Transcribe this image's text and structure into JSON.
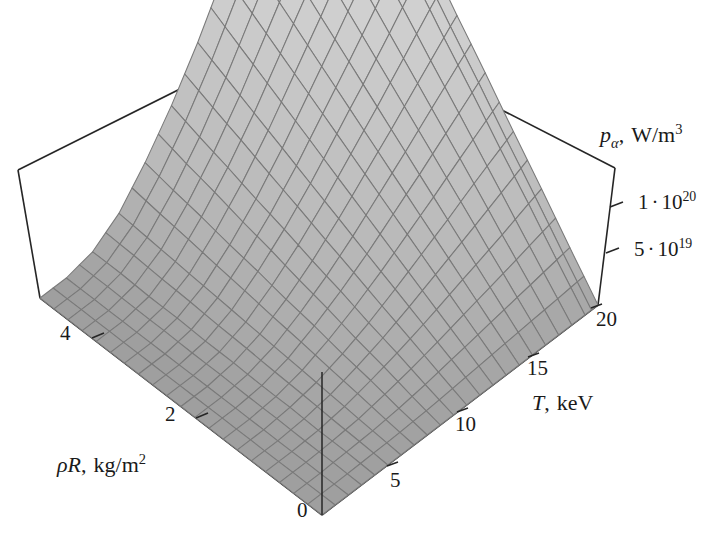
{
  "figure": {
    "type": "surface-3d",
    "background_color": "#ffffff",
    "frame_color": "#262626",
    "surface_mesh_line_color": "#7a7a7a",
    "surface_low_color": "#9a9a9a",
    "surface_high_color": "#e8e8e8"
  },
  "axes": {
    "x": {
      "name": "rho-R-axis",
      "label_symbol": "ρR",
      "label_comma": ",",
      "label_units": "kg/m",
      "label_units_exp": "2",
      "label_full": "ρR,  kg/m²",
      "ticks": [
        "4",
        "2",
        "0"
      ],
      "tick_values": [
        4,
        2,
        0
      ],
      "range": [
        0,
        5
      ]
    },
    "y": {
      "name": "temperature-axis",
      "label_symbol": "T",
      "label_comma": ",",
      "label_units": "keV",
      "label_full": "T,  keV",
      "ticks": [
        "5",
        "10",
        "15",
        "20"
      ],
      "tick_values": [
        5,
        10,
        15,
        20
      ],
      "range": [
        1,
        22
      ]
    },
    "z": {
      "name": "alpha-power-axis",
      "label_symbol": "p",
      "label_subscript": "α",
      "label_comma": ",",
      "label_units": "W/m",
      "label_units_exp": "3",
      "label_full": "pα,  W/m³",
      "ticks": [
        "1 · 10²⁰",
        "5 · 10¹⁹"
      ],
      "tick_mantissas": [
        "1",
        "5"
      ],
      "tick_exponents": [
        "20",
        "19"
      ],
      "tick_values": [
        1e+20,
        5e+19
      ],
      "range": [
        0,
        1.35e+20
      ]
    }
  },
  "chart_data": {
    "type": "surface",
    "title": "",
    "xlabel": "ρR, kg/m²",
    "ylabel": "T, keV",
    "zlabel": "pα, W/m³",
    "xlim": [
      0,
      5
    ],
    "ylim": [
      1,
      22
    ],
    "zlim": [
      0,
      1.35e+20
    ],
    "grid": false,
    "legend": "none",
    "x": [
      0,
      0.5,
      1,
      1.5,
      2,
      2.5,
      3,
      3.5,
      4,
      4.5,
      5
    ],
    "y": [
      1,
      3,
      5,
      7,
      9,
      11,
      13,
      15,
      17,
      19,
      21,
      22
    ],
    "z_description": "Alpha particle heating power density p_alpha rises steeply with temperature T and with areal density rho-R; near-zero plateau at low T, peak at high T and high rho-R.",
    "z": [
      [
        0.0,
        0.0,
        0.0,
        0.0,
        0.0,
        0.0,
        0.0,
        0.0,
        0.0,
        0.0,
        0.0
      ],
      [
        0.0,
        0.0,
        0.0,
        0.0,
        0.0,
        0.0,
        0.0,
        0.0,
        0.0,
        0.0,
        0.0
      ],
      [
        0.0,
        0.01,
        0.01,
        0.02,
        0.02,
        0.03,
        0.03,
        0.04,
        0.04,
        0.05,
        0.05
      ],
      [
        0.0,
        0.02,
        0.04,
        0.06,
        0.08,
        0.1,
        0.12,
        0.14,
        0.16,
        0.18,
        0.2
      ],
      [
        0.0,
        0.04,
        0.09,
        0.13,
        0.18,
        0.22,
        0.27,
        0.31,
        0.36,
        0.4,
        0.45
      ],
      [
        0.0,
        0.07,
        0.15,
        0.22,
        0.3,
        0.37,
        0.45,
        0.52,
        0.6,
        0.67,
        0.75
      ],
      [
        0.0,
        0.11,
        0.22,
        0.33,
        0.44,
        0.55,
        0.66,
        0.77,
        0.88,
        0.99,
        1.1
      ],
      [
        0.0,
        0.15,
        0.3,
        0.45,
        0.6,
        0.75,
        0.9,
        1.05,
        1.2,
        1.35,
        1.5
      ],
      [
        0.0,
        0.19,
        0.38,
        0.57,
        0.76,
        0.95,
        1.14,
        1.33,
        1.52,
        1.71,
        1.9
      ],
      [
        0.0,
        0.23,
        0.46,
        0.7,
        0.93,
        1.16,
        1.39,
        1.62,
        1.86,
        2.09,
        2.32
      ],
      [
        0.0,
        0.27,
        0.55,
        0.82,
        1.1,
        1.37,
        1.65,
        1.92,
        2.2,
        2.47,
        2.75
      ],
      [
        0.0,
        0.29,
        0.59,
        0.88,
        1.18,
        1.47,
        1.77,
        2.06,
        2.36,
        2.65,
        2.95
      ]
    ],
    "z_unit_scale": "1e20 W/m^3"
  }
}
